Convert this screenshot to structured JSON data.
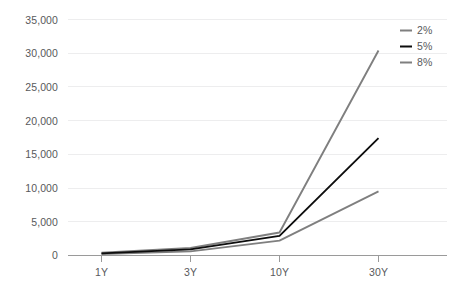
{
  "chart_data": {
    "type": "line",
    "title": "",
    "subtitle": "",
    "xlabel": "",
    "ylabel": "",
    "categories": [
      "1Y",
      "3Y",
      "10Y",
      "30Y"
    ],
    "series": [
      {
        "name": "2%",
        "color": "#7f7f7f",
        "values": [
          200,
          600,
          2200,
          9500
        ]
      },
      {
        "name": "5%",
        "color": "#0d0d0d",
        "values": [
          300,
          900,
          2900,
          17400
        ]
      },
      {
        "name": "8%",
        "color": "#7f7f7f",
        "values": [
          400,
          1100,
          3400,
          30400
        ]
      }
    ],
    "ylim": [
      0,
      35000
    ],
    "yticks": [
      0,
      5000,
      10000,
      15000,
      20000,
      25000,
      30000,
      35000
    ],
    "ytick_labels": [
      "0",
      "5,000",
      "10,000",
      "15,000",
      "20,000",
      "25,000",
      "30,000",
      "35,000"
    ],
    "xtick_labels": [
      "1Y",
      "3Y",
      "10Y",
      "30Y"
    ],
    "grid": true,
    "grid_axis": "y",
    "legend_position": "top-right",
    "legend_entries": [
      "2%",
      "5%",
      "8%"
    ],
    "colors": {
      "grid": "#ededee",
      "axis": "#9a9a9a",
      "text": "#58595b",
      "background": "#ffffff",
      "series_light": "#7f7f7f",
      "series_dark": "#0d0d0d"
    }
  }
}
